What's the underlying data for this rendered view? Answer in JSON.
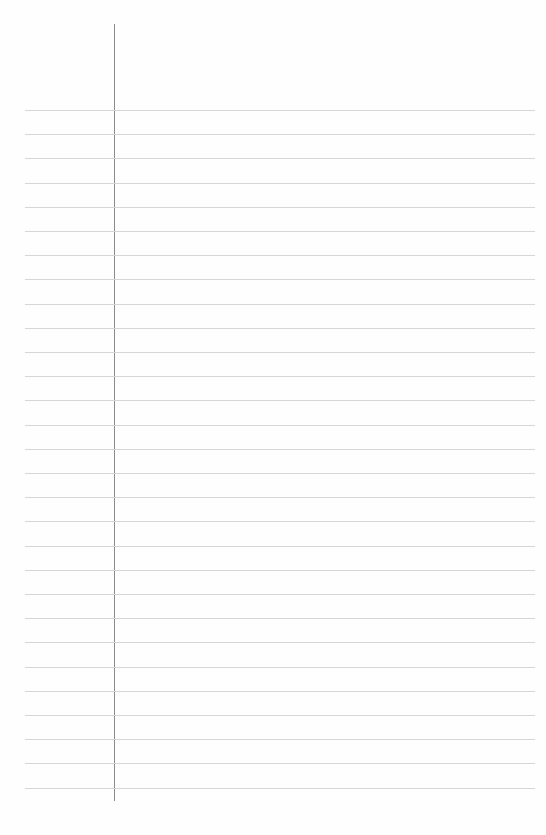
{
  "page": {
    "type": "lined-paper",
    "background_color": "#fefefe",
    "margin_line": {
      "x": 114,
      "top": 24,
      "bottom": 801,
      "color": "#8a8a8a"
    },
    "rules": {
      "count": 29,
      "first_y": 110,
      "spacing": 24.2,
      "left": 25,
      "right": 535,
      "color": "#d6d6d6"
    },
    "text_content": []
  }
}
